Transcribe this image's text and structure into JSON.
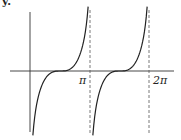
{
  "corner_label": "y.",
  "chart_data": {
    "type": "line",
    "title": "",
    "xlabel": "",
    "ylabel": "",
    "x_tick_labels": [
      "π",
      "2π"
    ],
    "x_ticks": [
      3.1416,
      6.2832
    ],
    "asymptotes_x": [
      3.1416,
      6.2832
    ],
    "grid": false,
    "legend": null,
    "series": [
      {
        "name": "branch 1",
        "description": "increasing curve on (0, π) with flat inflection at x = π/2, vertical asymptote at x = π",
        "x": [
          0.1,
          0.5,
          1.0,
          1.5708,
          2.1,
          2.6,
          3.0
        ],
        "y": [
          -1.0,
          -0.45,
          -0.12,
          0.0,
          0.12,
          0.45,
          1.0
        ]
      },
      {
        "name": "branch 2",
        "description": "increasing curve on (π, 2π) with flat inflection at x = 3π/2, vertical asymptote at x = 2π",
        "x": [
          3.24,
          3.64,
          4.14,
          4.7124,
          5.24,
          5.74,
          6.14
        ],
        "y": [
          -1.0,
          -0.45,
          -0.12,
          0.0,
          0.12,
          0.45,
          1.0
        ]
      }
    ],
    "colors": {
      "curve": "#222222",
      "axis": "#333333",
      "asymptote": "#555555"
    }
  }
}
